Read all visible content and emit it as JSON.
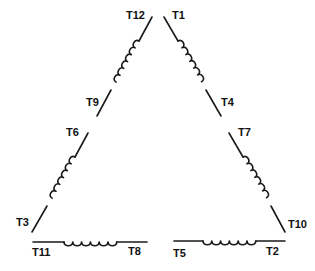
{
  "diagram": {
    "type": "delta-connected 12-lead motor winding",
    "terminals": {
      "t12": "T12",
      "t1": "T1",
      "t9": "T9",
      "t4": "T4",
      "t6": "T6",
      "t7": "T7",
      "t3": "T3",
      "t10": "T10",
      "t11": "T11",
      "t8": "T8",
      "t5": "T5",
      "t2": "T2"
    },
    "windings": [
      {
        "id": "left-upper",
        "from": "T12",
        "to": "T9"
      },
      {
        "id": "right-upper",
        "from": "T1",
        "to": "T4"
      },
      {
        "id": "left-lower",
        "from": "T6",
        "to": "T3"
      },
      {
        "id": "right-lower",
        "from": "T7",
        "to": "T10"
      },
      {
        "id": "bottom-left",
        "from": "T11",
        "to": "T8"
      },
      {
        "id": "bottom-right",
        "from": "T5",
        "to": "T2"
      }
    ],
    "colors": {
      "line": "#1a1a1a",
      "background": "#ffffff"
    }
  }
}
